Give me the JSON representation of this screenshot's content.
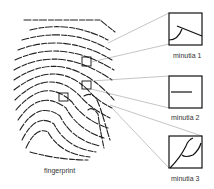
{
  "diagram": {
    "fingerprint_label": "fingerprint",
    "minutiae": [
      {
        "label": "minutia 1",
        "feature": "bifurcation"
      },
      {
        "label": "minutia 2",
        "feature": "ridge ending"
      },
      {
        "label": "minutia 3",
        "feature": "bifurcation"
      }
    ]
  }
}
